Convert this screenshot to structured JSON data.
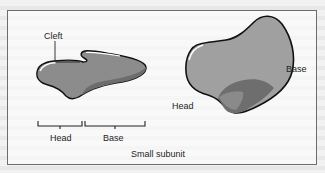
{
  "figure": {
    "caption": "Small subunit",
    "left_view": {
      "labels": {
        "cleft": "Cleft",
        "head": "Head",
        "base": "Base"
      }
    },
    "right_view": {
      "labels": {
        "head": "Head",
        "base": "Base"
      }
    },
    "colors": {
      "shape_fill": "#8a8a8a",
      "shape_dark": "#6a6a6a",
      "right_fill": "#9a9a9a",
      "outline": "#111111",
      "highlight": "#ffffff"
    }
  }
}
